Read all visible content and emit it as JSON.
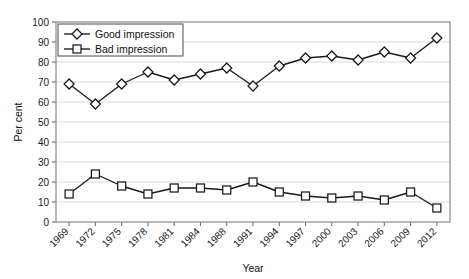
{
  "chart_data": {
    "type": "line",
    "title": "",
    "xlabel": "Year",
    "ylabel": "Per cent",
    "ylim": [
      0,
      100
    ],
    "ytick_step": 10,
    "yticks": [
      0,
      10,
      20,
      30,
      40,
      50,
      60,
      70,
      80,
      90,
      100
    ],
    "grid": true,
    "grid_axis": "y",
    "legend_position": "top-left-inside",
    "categories": [
      "1969",
      "1972",
      "1975",
      "1978",
      "1981",
      "1984",
      "1988",
      "1991",
      "1994",
      "1997",
      "2000",
      "2003",
      "2006",
      "2009",
      "2012"
    ],
    "series": [
      {
        "name": "Good impression",
        "marker": "diamond",
        "values": [
          69,
          59,
          69,
          75,
          71,
          74,
          77,
          68,
          78,
          82,
          83,
          81,
          85,
          82,
          92
        ]
      },
      {
        "name": "Bad impression",
        "marker": "square",
        "values": [
          14,
          24,
          18,
          14,
          17,
          17,
          16,
          20,
          15,
          13,
          12,
          13,
          11,
          15,
          7
        ]
      }
    ],
    "colors": {
      "line": "#1a1a1a",
      "marker_fill": "#ffffff",
      "gridline": "#d9d9d9",
      "frame": "#8a8a8a",
      "text": "#111111"
    }
  },
  "axes": {
    "y_title": "Per cent",
    "x_title": "Year"
  },
  "legend": {
    "items": [
      {
        "label": "Good impression",
        "marker": "diamond-marker"
      },
      {
        "label": "Bad impression",
        "marker": "square-marker"
      }
    ]
  }
}
